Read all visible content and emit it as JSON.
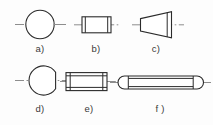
{
  "figure": {
    "background_color": "#fdfdfd",
    "line_color": "#2b2b2b",
    "centerline_color": "#8d8d8d",
    "label_color": "#3a3a3a",
    "rows": 2,
    "columns": 3
  },
  "items": [
    {
      "id": "a",
      "label": "a)",
      "shape": "circle",
      "description": "circular end view with horizontal centerline",
      "label_x": 40,
      "label_y": 52
    },
    {
      "id": "b",
      "label": "b)",
      "shape": "short-cylindrical-pin",
      "description": "short cylindrical pin with chamfered ends",
      "label_x": 96,
      "label_y": 52
    },
    {
      "id": "c",
      "label": "c)",
      "shape": "taper-pin",
      "description": "tapered conical pin, narrow left wide right",
      "label_x": 156,
      "label_y": 52
    },
    {
      "id": "d",
      "label": "d)",
      "shape": "flattened-circle",
      "description": "circular end view flattened on right side",
      "label_x": 40,
      "label_y": 112
    },
    {
      "id": "e",
      "label": "e)",
      "shape": "long-cylindrical-pin",
      "description": "long cylindrical dowel pin with chamfered ends",
      "label_x": 89,
      "label_y": 112
    },
    {
      "id": "f",
      "label": "f )",
      "shape": "rounded-end-pin",
      "description": "long slender pin with domed rounded ends",
      "label_x": 160,
      "label_y": 112
    }
  ]
}
